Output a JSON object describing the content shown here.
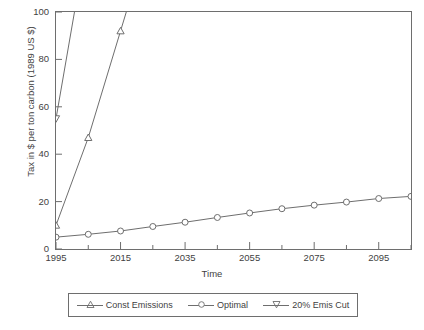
{
  "chart_data": {
    "type": "line",
    "title": "",
    "xlabel": "Time",
    "ylabel": "Tax in $ per ton carbon (1989 US $)",
    "xlim": [
      1995,
      2105
    ],
    "ylim": [
      0,
      100
    ],
    "grid": false,
    "legend_position": "below-plot",
    "y_ticks": [
      0,
      20,
      40,
      60,
      80,
      100
    ],
    "y_tick_labels": [
      "0",
      "20",
      "40",
      "60",
      "80",
      "100"
    ],
    "x_ticks": [
      1995,
      2005,
      2015,
      2025,
      2035,
      2045,
      2055,
      2065,
      2075,
      2085,
      2095,
      2105
    ],
    "x_tick_labels_major": [
      "1995",
      "2015",
      "2035",
      "2055",
      "2075",
      "2095"
    ],
    "x_major_values": [
      1995,
      2015,
      2035,
      2055,
      2075,
      2095
    ],
    "series": [
      {
        "name": "Const Emissions",
        "marker": "triangle-up",
        "color": "#6e6e6e",
        "x": [
          1995,
          2005,
          2015,
          2019
        ],
        "values": [
          10,
          47,
          92,
          110
        ]
      },
      {
        "name": "Optimal",
        "marker": "circle",
        "color": "#6e6e6e",
        "x": [
          1995,
          2005,
          2015,
          2025,
          2035,
          2045,
          2055,
          2065,
          2075,
          2085,
          2095,
          2105
        ],
        "values": [
          5.0,
          6.2,
          7.6,
          9.5,
          11.3,
          13.3,
          15.2,
          17.0,
          18.5,
          19.8,
          21.3,
          22.2
        ]
      },
      {
        "name": "20% Emis Cut",
        "marker": "triangle-down",
        "color": "#6e6e6e",
        "x": [
          1995,
          2002
        ],
        "values": [
          55,
          110
        ]
      }
    ]
  },
  "axis": {
    "y_title": "Tax in $ per ton carbon (1989 US $)",
    "x_title": "Time"
  },
  "legend": {
    "items": [
      {
        "label": "Const Emissions",
        "marker": "triangle-up-icon"
      },
      {
        "label": "Optimal",
        "marker": "circle-icon"
      },
      {
        "label": "20% Emis Cut",
        "marker": "triangle-down-icon"
      }
    ]
  },
  "caption": ""
}
